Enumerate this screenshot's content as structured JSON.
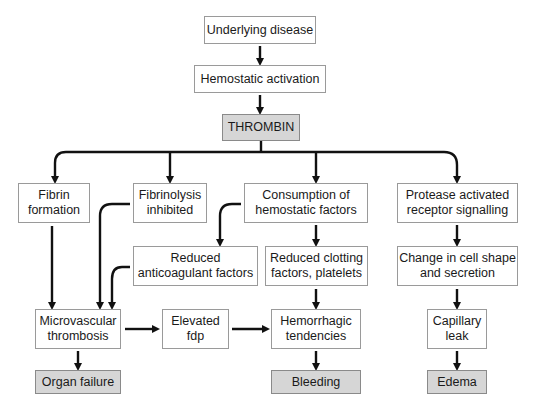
{
  "diagram": {
    "type": "flowchart",
    "colors": {
      "box_border": "#9a9a9a",
      "shaded_fill": "#d6d6d6",
      "arrow": "#111111",
      "text": "#1a1a1a"
    },
    "nodes": {
      "underlying_disease": "Underlying disease",
      "hemostatic_activation": "Hemostatic activation",
      "thrombin": "THROMBIN",
      "fibrin_formation": "Fibrin\nformation",
      "fibrinolysis_inhibited": "Fibrinolysis\ninhibited",
      "consumption": "Consumption of\nhemostatic factors",
      "protease": "Protease activated\nreceptor signalling",
      "reduced_anticoagulant": "Reduced\nanticoagulant factors",
      "reduced_clotting": "Reduced clotting\nfactors, platelets",
      "cell_shape": "Change in cell shape\nand secretion",
      "microvascular": "Microvascular\nthrombosis",
      "elevated_fdp": "Elevated\nfdp",
      "hemorrhagic": "Hemorrhagic\ntendencies",
      "capillary_leak": "Capillary\nleak",
      "organ_failure": "Organ failure",
      "bleeding": "Bleeding",
      "edema": "Edema"
    },
    "edges": [
      [
        "Underlying disease",
        "Hemostatic activation"
      ],
      [
        "Hemostatic activation",
        "THROMBIN"
      ],
      [
        "THROMBIN",
        "Fibrin formation"
      ],
      [
        "THROMBIN",
        "Fibrinolysis inhibited"
      ],
      [
        "THROMBIN",
        "Consumption of hemostatic factors"
      ],
      [
        "THROMBIN",
        "Protease activated receptor signalling"
      ],
      [
        "Fibrin formation",
        "Microvascular thrombosis"
      ],
      [
        "Fibrinolysis inhibited",
        "Microvascular thrombosis"
      ],
      [
        "Consumption of hemostatic factors",
        "Reduced anticoagulant factors"
      ],
      [
        "Consumption of hemostatic factors",
        "Reduced clotting factors, platelets"
      ],
      [
        "Reduced anticoagulant factors",
        "Microvascular thrombosis"
      ],
      [
        "Reduced clotting factors, platelets",
        "Hemorrhagic tendencies"
      ],
      [
        "Protease activated receptor signalling",
        "Change in cell shape and secretion"
      ],
      [
        "Change in cell shape and secretion",
        "Capillary leak"
      ],
      [
        "Microvascular thrombosis",
        "Elevated fdp"
      ],
      [
        "Elevated fdp",
        "Hemorrhagic tendencies"
      ],
      [
        "Microvascular thrombosis",
        "Organ failure"
      ],
      [
        "Hemorrhagic tendencies",
        "Bleeding"
      ],
      [
        "Capillary leak",
        "Edema"
      ]
    ]
  }
}
